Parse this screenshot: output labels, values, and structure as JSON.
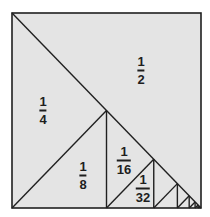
{
  "diagram": {
    "type": "geometric-series-square",
    "square": {
      "x": 12,
      "y": 13,
      "width": 189,
      "height": 195
    },
    "colors": {
      "fill": "#e4e4e4",
      "stroke": "#202020",
      "background": "#ffffff"
    },
    "levels": 8,
    "labels": [
      {
        "id": "half",
        "numerator": "1",
        "denominator": "2",
        "x": 141,
        "y": 70
      },
      {
        "id": "quarter",
        "numerator": "1",
        "denominator": "4",
        "x": 43,
        "y": 110
      },
      {
        "id": "eighth",
        "numerator": "1",
        "denominator": "8",
        "x": 83,
        "y": 175
      },
      {
        "id": "sixteenth",
        "numerator": "1",
        "denominator": "16",
        "x": 124,
        "y": 160
      },
      {
        "id": "thirty-second",
        "numerator": "1",
        "denominator": "32",
        "x": 143,
        "y": 188
      }
    ]
  }
}
